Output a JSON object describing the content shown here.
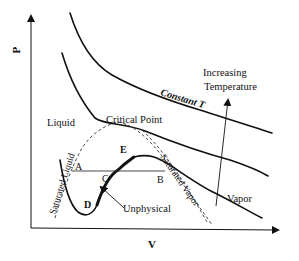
{
  "diagram": {
    "axes": {
      "x_label": "V",
      "y_label": "P"
    },
    "labels": {
      "constant_t": "Constant T",
      "increasing_temperature_line1": "Increasing",
      "increasing_temperature_line2": "Temperature",
      "critical_point": "Critical Point",
      "liquid": "Liquid",
      "vapor": "Vapor",
      "saturated_liquid": "Saturated Liquid",
      "saturated_vapor": "Saturated Vapor",
      "unphysical": "Unphysical"
    },
    "points": {
      "A": "A",
      "B": "B",
      "C": "C",
      "D": "D",
      "E": "E"
    },
    "isotherms": [
      "high T",
      "critical T",
      "subcritical T"
    ]
  }
}
